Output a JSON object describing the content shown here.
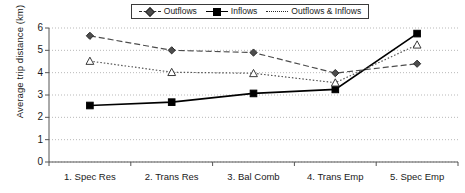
{
  "chart_data": {
    "type": "line",
    "title": "",
    "xlabel": "",
    "ylabel": "Average trip distance (km)",
    "categories": [
      "1. Spec Res",
      "2. Trans Res",
      "3. Bal Comb",
      "4. Trans Emp",
      "5. Spec Emp"
    ],
    "ylim": [
      0,
      6
    ],
    "yticks": [
      0,
      1,
      2,
      3,
      4,
      5,
      6
    ],
    "grid": "horizontal-dotted",
    "legend_position": "top-center",
    "series": [
      {
        "name": "Outflows",
        "values": [
          5.65,
          5.0,
          4.9,
          3.98,
          4.4
        ],
        "line_style": "dashed",
        "marker": "diamond",
        "color": "#4d4d4d"
      },
      {
        "name": "Inflows",
        "values": [
          2.53,
          2.68,
          3.07,
          3.25,
          5.75
        ],
        "line_style": "solid",
        "marker": "square",
        "color": "#000000"
      },
      {
        "name": "Outflows & Inflows",
        "values": [
          4.52,
          4.02,
          3.97,
          3.55,
          5.25
        ],
        "line_style": "dotted",
        "marker": "triangle-open",
        "color": "#555555"
      }
    ]
  },
  "axis": {
    "y_title": "Average trip distance (km)",
    "y_tick_labels": [
      "0",
      "1",
      "2",
      "3",
      "4",
      "5",
      "6"
    ],
    "x_tick_labels": [
      "1. Spec Res",
      "2. Trans Res",
      "3. Bal Comb",
      "4. Trans Emp",
      "5. Spec Emp"
    ]
  },
  "legend": {
    "items": [
      {
        "label": "Outflows"
      },
      {
        "label": "Inflows"
      },
      {
        "label": "Outflows & Inflows"
      }
    ]
  }
}
